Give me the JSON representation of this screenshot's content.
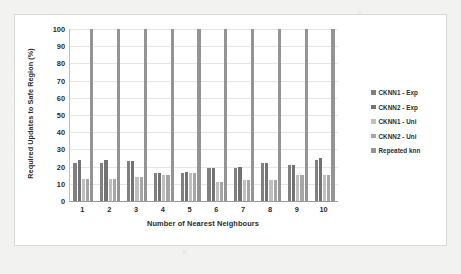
{
  "chart_data": {
    "type": "bar",
    "title": "",
    "xlabel": "Number of Nearest Neighbours",
    "ylabel": "Required Updates to Safe Region (%)",
    "categories": [
      "1",
      "2",
      "3",
      "4",
      "5",
      "6",
      "7",
      "8",
      "9",
      "10"
    ],
    "ylim": [
      0,
      100
    ],
    "ytick_values": [
      0,
      10,
      20,
      30,
      40,
      50,
      60,
      70,
      80,
      90,
      100
    ],
    "ytick_labels": [
      "0",
      "10",
      "20",
      "30",
      "40",
      "50",
      "60",
      "70",
      "80",
      "90",
      "100"
    ],
    "grid": true,
    "legend_position": "right",
    "series": [
      {
        "name": "CKNN1 - Exp",
        "color": "#808080",
        "values": [
          22,
          22,
          23,
          16,
          16,
          19,
          19,
          22,
          21,
          24
        ]
      },
      {
        "name": "CKNN2 - Exp",
        "color": "#737373",
        "values": [
          24,
          24,
          23,
          16,
          17,
          19,
          20,
          22,
          21,
          25
        ]
      },
      {
        "name": "CKNN1 - Uni",
        "color": "#bfbfbf",
        "values": [
          13,
          13,
          14,
          15,
          16,
          11,
          12,
          12,
          15,
          15
        ]
      },
      {
        "name": "CKNN2 - Uni",
        "color": "#a6a6a6",
        "values": [
          13,
          13,
          14,
          15,
          16,
          11,
          12,
          12,
          15,
          15
        ]
      },
      {
        "name": "Repeated knn",
        "color": "#949494",
        "values": [
          100,
          100,
          100,
          100,
          100,
          100,
          100,
          100,
          100,
          100
        ]
      }
    ]
  },
  "legend": {
    "items": [
      {
        "label": "CKNN1 - Exp"
      },
      {
        "label": "CKNN2 - Exp"
      },
      {
        "label": "CKNN1 - Uni"
      },
      {
        "label": "CKNN2 - Uni"
      },
      {
        "label": "Repeated knn"
      }
    ]
  }
}
